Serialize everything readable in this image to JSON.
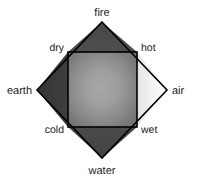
{
  "diagram": {
    "type": "element-quality-diamond",
    "elements": [
      {
        "id": "fire",
        "label": "fire",
        "position": "top",
        "fill": "#4a4a4a"
      },
      {
        "id": "earth",
        "label": "earth",
        "position": "left",
        "fill": "#3a3a3a"
      },
      {
        "id": "air",
        "label": "air",
        "position": "right",
        "fill": "#f2f2f2"
      },
      {
        "id": "water",
        "label": "water",
        "position": "bottom",
        "fill": "#474747"
      }
    ],
    "qualities": [
      {
        "id": "dry",
        "label": "dry",
        "position": "top-left"
      },
      {
        "id": "hot",
        "label": "hot",
        "position": "top-right"
      },
      {
        "id": "cold",
        "label": "cold",
        "position": "bottom-left"
      },
      {
        "id": "wet",
        "label": "wet",
        "position": "bottom-right"
      }
    ],
    "center": {
      "id": "center-square",
      "label": "",
      "gradient_center": "#a2a2a2",
      "gradient_edge": "#767676"
    },
    "colors": {
      "background": "#ffffff",
      "stroke": "#000000",
      "text": "#1c1c1c"
    }
  }
}
